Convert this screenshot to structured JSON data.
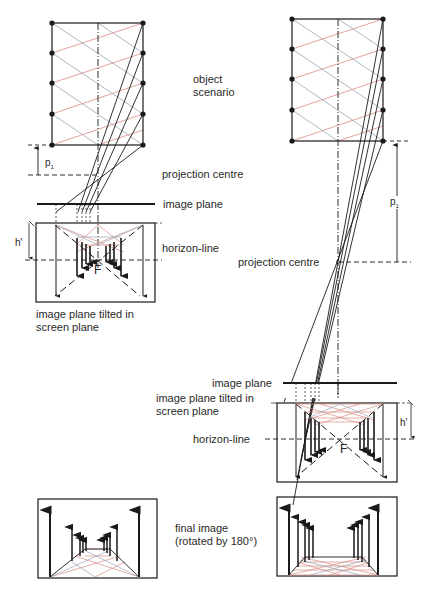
{
  "labels": {
    "object_scenario_l1": "object",
    "object_scenario_l2": "scenario",
    "projection_centre_left": "projection centre",
    "image_plane_left": "image plane",
    "horizon_line_left": "horizon-line",
    "tilted_left_l1": "image plane tilted in",
    "tilted_left_l2": "screen plane",
    "projection_centre_right": "projection centre",
    "image_plane_right": "image plane",
    "tilted_right_l1": "image plane tilted in",
    "tilted_right_l2": "screen plane",
    "horizon_line_right": "horizon-line",
    "final_image_l1": "final image",
    "final_image_l2": "(rotated by 180°)"
  },
  "symbols": {
    "p": "p",
    "p_sub": "1",
    "h_prime": "h'",
    "focal": "F"
  },
  "colors": {
    "line": "#1a1a1a",
    "grid_red": "#d98c84",
    "grid_blue": "#9aa4b8",
    "text": "#2a2a2a"
  },
  "panels": [
    {
      "name": "short-distance",
      "object_grid": {
        "x": 52,
        "y": 23,
        "w": 91,
        "h": 122
      },
      "projection_centre": [
        98,
        175
      ],
      "image_plane_y": 204
    },
    {
      "name": "long-distance",
      "object_grid": {
        "x": 292,
        "y": 19,
        "w": 91,
        "h": 122
      },
      "projection_centre": [
        338,
        262
      ],
      "image_plane_y": 383
    }
  ]
}
